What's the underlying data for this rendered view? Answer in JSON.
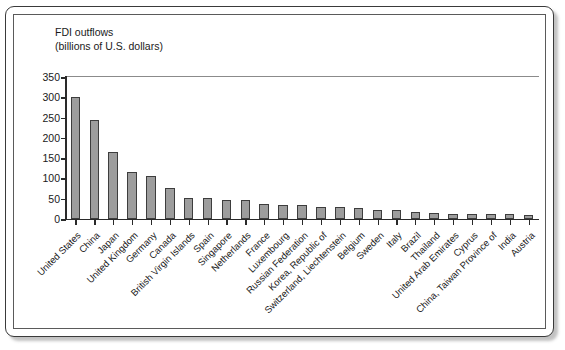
{
  "chart_data": {
    "type": "bar",
    "title_line1": "FDI outflows",
    "title_line2": "(billions of U.S. dollars)",
    "xlabel": "",
    "ylabel": "",
    "ylim": [
      0,
      350
    ],
    "yticks": [
      0,
      50,
      100,
      150,
      200,
      250,
      300,
      350
    ],
    "ytick_labels": [
      "0",
      "50",
      "100",
      "150",
      "200",
      "250",
      "300",
      "350"
    ],
    "grid": false,
    "legend": "none",
    "bar_color": "#9d9d9d",
    "bar_edge_color": "#3d3d3d",
    "categories": [
      "United States",
      "China",
      "Japan",
      "United Kingdom",
      "Germany",
      "Canada",
      "British Virgin Islands",
      "Spain",
      "Singapore",
      "Netherlands",
      "France",
      "Luxembourg",
      "Russian Federation",
      "Korea, Republic of",
      "Switzerland, Liechtenstein",
      "Belgium",
      "Sweden",
      "Italy",
      "Brazil",
      "Thailand",
      "United Arab Emirates",
      "Cyprus",
      "China, Taiwan Province of",
      "India",
      "Austria"
    ],
    "values": [
      300,
      244,
      165,
      117,
      105,
      77,
      52,
      51,
      48,
      47,
      36,
      35,
      34,
      30,
      29,
      27,
      22,
      21,
      17,
      16,
      13,
      13,
      12,
      12,
      11
    ]
  }
}
